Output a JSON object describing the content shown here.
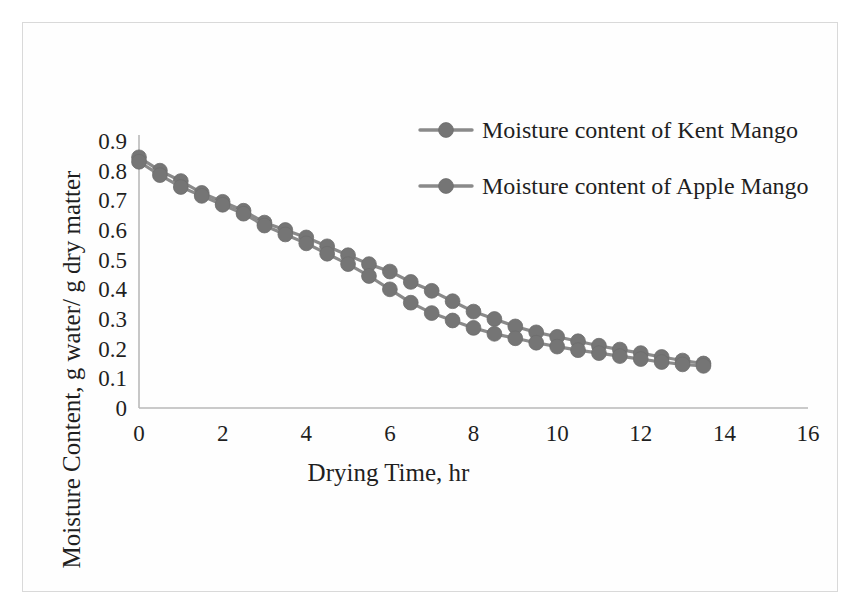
{
  "figure": {
    "frame_color": "#d9d9d9",
    "background": "#fefefe"
  },
  "chart_data": {
    "type": "line",
    "title": "",
    "xlabel": "Drying Time, hr",
    "ylabel": "Moisture Content, g water/ g dry matter",
    "xlim": [
      0,
      16
    ],
    "ylim": [
      0,
      0.9
    ],
    "xticks": [
      0,
      2,
      4,
      6,
      8,
      10,
      12,
      14,
      16
    ],
    "xtick_labels": [
      "0",
      "2",
      "4",
      "6",
      "8",
      "10",
      "12",
      "14",
      "16"
    ],
    "yticks": [
      0,
      0.1,
      0.2,
      0.3,
      0.4,
      0.5,
      0.6,
      0.7,
      0.8,
      0.9
    ],
    "ytick_labels": [
      "0",
      "0.1",
      "0.2",
      "0.3",
      "0.4",
      "0.5",
      "0.6",
      "0.7",
      "0.8",
      "0.9"
    ],
    "grid": false,
    "legend_position": "top-right",
    "marker": "circle",
    "marker_color": "#757575",
    "line_color": "#8a8a8a",
    "x": [
      0,
      0.5,
      1,
      1.5,
      2,
      2.5,
      3,
      3.5,
      4,
      4.5,
      5,
      5.5,
      6,
      6.5,
      7,
      7.5,
      8,
      8.5,
      9,
      9.5,
      10,
      10.5,
      11,
      11.5,
      12,
      12.5,
      13,
      13.5
    ],
    "series": [
      {
        "name": "Moisture content of Kent Mango",
        "values": [
          0.845,
          0.8,
          0.765,
          0.725,
          0.695,
          0.665,
          0.625,
          0.6,
          0.575,
          0.545,
          0.515,
          0.485,
          0.46,
          0.425,
          0.395,
          0.36,
          0.325,
          0.3,
          0.275,
          0.255,
          0.24,
          0.225,
          0.21,
          0.197,
          0.185,
          0.172,
          0.16,
          0.15
        ]
      },
      {
        "name": "Moisture content of Apple Mango",
        "values": [
          0.83,
          0.785,
          0.745,
          0.715,
          0.685,
          0.655,
          0.615,
          0.585,
          0.555,
          0.52,
          0.485,
          0.445,
          0.4,
          0.355,
          0.32,
          0.295,
          0.27,
          0.25,
          0.235,
          0.22,
          0.207,
          0.195,
          0.185,
          0.175,
          0.165,
          0.155,
          0.147,
          0.142
        ]
      }
    ],
    "legend_entries": [
      "Moisture content of Kent Mango",
      "Moisture content of Apple Mango"
    ]
  }
}
